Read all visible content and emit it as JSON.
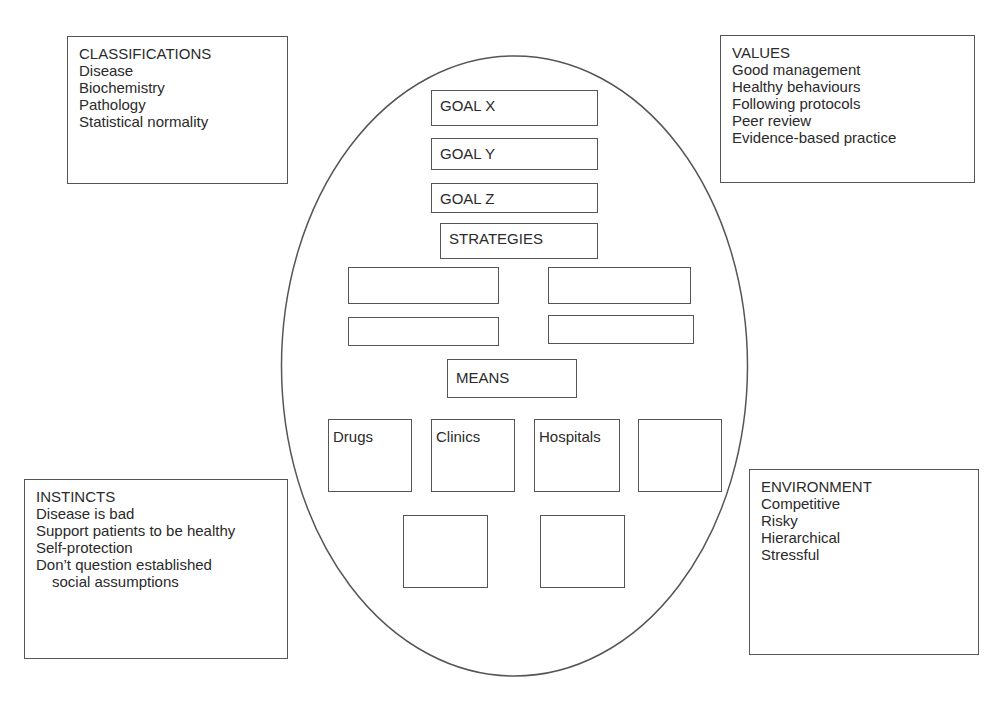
{
  "classifications": {
    "title": "CLASSIFICATIONS",
    "items": [
      "Disease",
      "Biochemistry",
      "Pathology",
      "Statistical normality"
    ]
  },
  "values": {
    "title": "VALUES",
    "items": [
      "Good management",
      "Healthy behaviours",
      "Following protocols",
      "Peer review",
      "Evidence-based practice"
    ]
  },
  "instincts": {
    "title": "INSTINCTS",
    "items": [
      "Disease is bad",
      "Support patients to be healthy",
      "Self-protection",
      "Don’t question established",
      "social assumptions"
    ]
  },
  "environment": {
    "title": "ENVIRONMENT",
    "items": [
      "Competitive",
      "Risky",
      "Hierarchical",
      "Stressful"
    ]
  },
  "center": {
    "goals": [
      "GOAL X",
      "GOAL Y",
      "GOAL Z"
    ],
    "strategies_label": "STRATEGIES",
    "strategy_boxes": [
      "",
      "",
      "",
      ""
    ],
    "means_label": "MEANS",
    "means_boxes": [
      "Drugs",
      "Clinics",
      "Hospitals",
      "",
      "",
      ""
    ]
  },
  "colors": {
    "stroke": "#555555",
    "text": "#2a2a2a",
    "background": "#ffffff"
  }
}
